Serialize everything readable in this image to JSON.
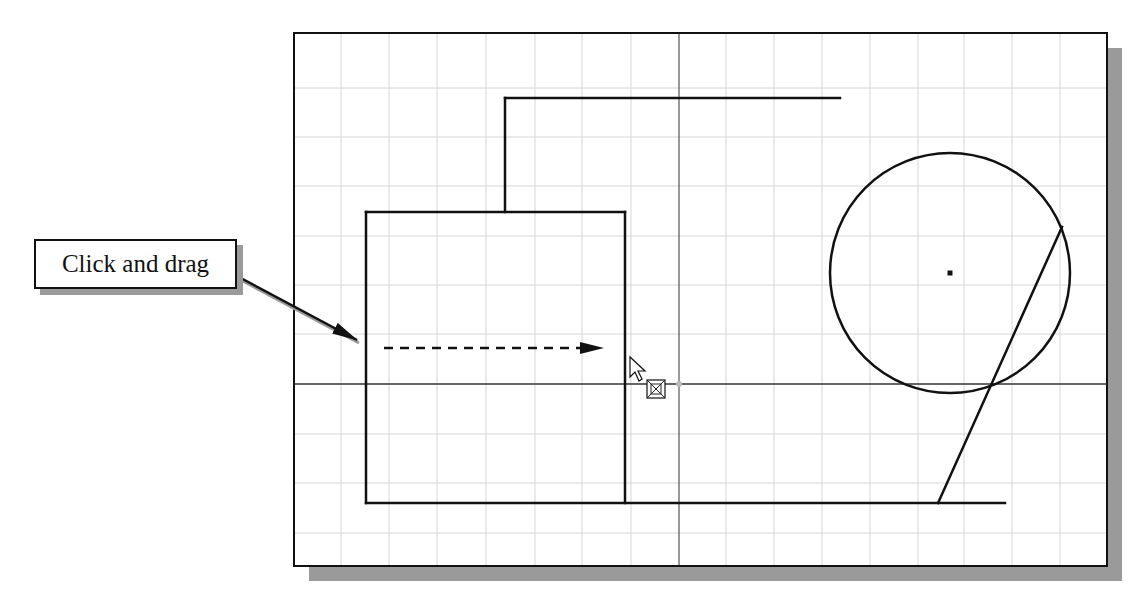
{
  "callout": {
    "label": "Click and drag"
  },
  "colors": {
    "ink": "#111111",
    "grid": "#d6d6d6",
    "shadow": "#9a9a9a",
    "background": "#ffffff"
  },
  "viewport": {
    "frame": {
      "x": 294,
      "y": 33,
      "width": 813,
      "height": 533
    },
    "shadow_offset": 15,
    "grid": {
      "vertical_x": [
        341,
        389,
        437,
        486,
        535,
        582,
        631,
        726,
        774,
        822,
        870,
        918,
        964,
        1012,
        1060
      ],
      "horizontal_y": [
        88,
        137,
        186,
        236,
        285,
        334,
        434,
        483,
        533
      ]
    },
    "axes": {
      "x_axis_y": 384,
      "y_axis_x": 679
    }
  },
  "entities": {
    "lines": [
      {
        "name": "upper-horizontal-line",
        "x1": 505,
        "y1": 98,
        "x2": 840,
        "y2": 98
      },
      {
        "name": "upper-vertical-line",
        "x1": 505,
        "y1": 98,
        "x2": 505,
        "y2": 212
      },
      {
        "name": "box-top-line",
        "x1": 366,
        "y1": 212,
        "x2": 625,
        "y2": 212
      },
      {
        "name": "box-left-line",
        "x1": 366,
        "y1": 212,
        "x2": 366,
        "y2": 503
      },
      {
        "name": "box-right-line",
        "x1": 625,
        "y1": 212,
        "x2": 625,
        "y2": 503
      },
      {
        "name": "bottom-line",
        "x1": 366,
        "y1": 503,
        "x2": 1005,
        "y2": 503
      },
      {
        "name": "diagonal-line",
        "x1": 1062,
        "y1": 227,
        "x2": 938,
        "y2": 503
      }
    ],
    "circle": {
      "cx": 950,
      "cy": 273,
      "r": 120,
      "center_marker_size": 5
    }
  },
  "annotations": {
    "leader_arrow": {
      "x1": 237,
      "y1": 276,
      "x2": 357,
      "y2": 340
    },
    "drag_arrow": {
      "x1": 384,
      "y1": 348,
      "x2": 604,
      "y2": 348,
      "dash": "9 7"
    }
  },
  "cursor": {
    "x": 630,
    "y": 357,
    "move_icon_x": 656,
    "move_icon_y": 389
  }
}
